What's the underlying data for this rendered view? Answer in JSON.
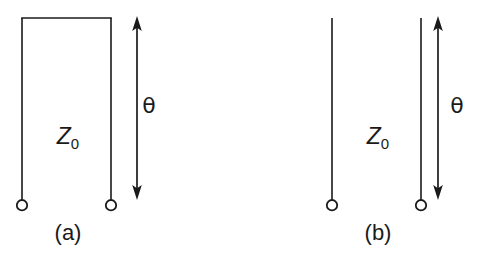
{
  "figure": {
    "kind": "transmission-line-stub-diagram",
    "background_color": "#ffffff",
    "ink_color": "#1a1a1a",
    "width": 483,
    "height": 256,
    "panels": [
      {
        "id": "a",
        "caption": "(a)",
        "caption_x": 68,
        "caption_y": 233,
        "termination": "short-circuited",
        "impedance_label": "Z",
        "impedance_subscript": "0",
        "impedance_x": 68,
        "impedance_y": 136,
        "length_label": "θ",
        "length_x": 149,
        "length_y": 106,
        "left_conductor_x": 22,
        "right_conductor_x": 111,
        "conductor_top_y": 18,
        "conductor_bottom_y": 199,
        "short_bar_y": 18,
        "terminal_circle_y": 205,
        "terminal_circle_r": 5.2,
        "dimension_x": 137,
        "dimension_top_y": 17,
        "dimension_bottom_y": 199
      },
      {
        "id": "b",
        "caption": "(b)",
        "caption_x": 378,
        "caption_y": 233,
        "termination": "open-circuited",
        "impedance_label": "Z",
        "impedance_subscript": "0",
        "impedance_x": 378,
        "impedance_y": 136,
        "length_label": "θ",
        "length_x": 457,
        "length_y": 106,
        "left_conductor_x": 332,
        "right_conductor_x": 421,
        "conductor_top_y": 18,
        "conductor_bottom_y": 199,
        "terminal_circle_y": 205,
        "terminal_circle_r": 5.2,
        "dimension_x": 438,
        "dimension_top_y": 17,
        "dimension_bottom_y": 199
      }
    ]
  }
}
